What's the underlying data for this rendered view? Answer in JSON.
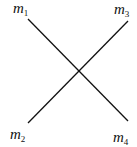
{
  "diagram": {
    "labels": {
      "top_left": {
        "base": "m",
        "sub": "1"
      },
      "top_right": {
        "base": "m",
        "sub": "3"
      },
      "bottom_left": {
        "base": "m",
        "sub": "2"
      },
      "bottom_right": {
        "base": "m",
        "sub": "4"
      }
    },
    "line_color": "#111111"
  }
}
